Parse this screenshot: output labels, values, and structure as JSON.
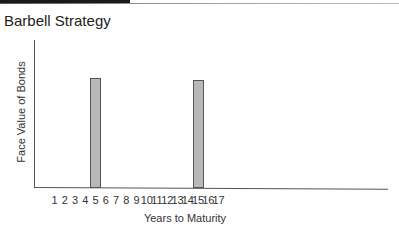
{
  "chart_data": {
    "type": "bar",
    "title": "Barbell Strategy",
    "xlabel": "Years to Maturity",
    "ylabel": "Face Value of Bonds",
    "categories": [
      "1",
      "2",
      "3",
      "4",
      "5",
      "6",
      "7",
      "8",
      "9",
      "10",
      "11",
      "12",
      "13",
      "14",
      "15",
      "16",
      "17"
    ],
    "values": [
      0,
      0,
      0,
      0,
      100,
      0,
      0,
      0,
      0,
      0,
      0,
      0,
      0,
      0,
      98,
      0,
      0
    ],
    "ylim": [
      0,
      125
    ],
    "grid": false,
    "legend": null,
    "bar_color": "#b8b8b8",
    "bar_edge_color": "#555555"
  }
}
